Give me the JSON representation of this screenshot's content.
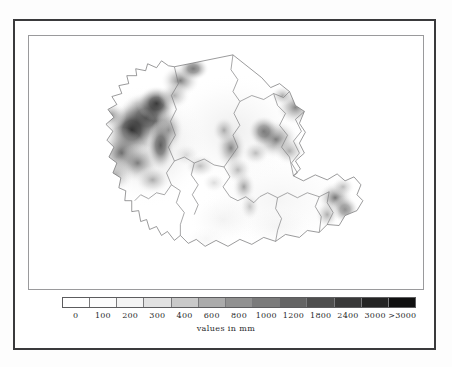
{
  "figure": {
    "kind": "choropleth-raster-map",
    "background_color": "#ffffff",
    "outer_frame_color": "#3a3a3c",
    "inner_frame_color": "#9a9a9c"
  },
  "chart_data": {
    "type": "heatmap",
    "title": "",
    "subtitle": "",
    "xlabel": "",
    "ylabel": "",
    "legend_position": "bottom",
    "grid": false,
    "colormap": "grayscale-white-to-black",
    "units": "mm",
    "caption": "values in mm",
    "colorbar": {
      "orientation": "horizontal",
      "boundaries": [
        0,
        100,
        200,
        300,
        400,
        600,
        800,
        1000,
        1200,
        1800,
        2400,
        3000,
        3000
      ],
      "tick_labels": [
        "0",
        "100",
        "200",
        "300",
        "400",
        "600",
        "800",
        "1000",
        "1200",
        "1800",
        "2400",
        "3000",
        ">3000"
      ],
      "segment_count": 13,
      "segment_colors": [
        "#ffffff",
        "#fcfcfc",
        "#f4f4f4",
        "#e2e2e2",
        "#c9c9c9",
        "#ababab",
        "#919191",
        "#7b7b7b",
        "#646464",
        "#4e4e4e",
        "#393939",
        "#242424",
        "#101010"
      ]
    },
    "map": {
      "outline_color": "#6e6e70",
      "district_count": 11,
      "regions": [
        {
          "name": "north-west-highland",
          "mean_value_mm": 2400,
          "shade": "#4a4a4a"
        },
        {
          "name": "far-west",
          "mean_value_mm": 1800,
          "shade": "#5f5f5f"
        },
        {
          "name": "north-central-plain",
          "mean_value_mm": 300,
          "shade": "#e2e2e2"
        },
        {
          "name": "north-east-ridge",
          "mean_value_mm": 1200,
          "shade": "#7b7b7b"
        },
        {
          "name": "east-central",
          "mean_value_mm": 1800,
          "shade": "#5f5f5f"
        },
        {
          "name": "central-basin",
          "mean_value_mm": 200,
          "shade": "#f4f4f4"
        },
        {
          "name": "mid-south-band",
          "mean_value_mm": 800,
          "shade": "#919191"
        },
        {
          "name": "south-west-lowland",
          "mean_value_mm": 100,
          "shade": "#fcfcfc"
        },
        {
          "name": "south-central-lowland",
          "mean_value_mm": 100,
          "shade": "#fcfcfc"
        },
        {
          "name": "south-east-lowland",
          "mean_value_mm": 200,
          "shade": "#f4f4f4"
        },
        {
          "name": "far-south-east-hills",
          "mean_value_mm": 1800,
          "shade": "#5f5f5f"
        }
      ],
      "high_value_clusters": [
        {
          "label": "north-west massif",
          "value_mm": 3000
        },
        {
          "label": "west escarpment",
          "value_mm": 2400
        },
        {
          "label": "north-east ridge",
          "value_mm": 1200
        },
        {
          "label": "east-central ridge",
          "value_mm": 1800
        },
        {
          "label": "central divide",
          "value_mm": 1200
        },
        {
          "label": "south-east hills",
          "value_mm": 1800
        }
      ]
    }
  }
}
